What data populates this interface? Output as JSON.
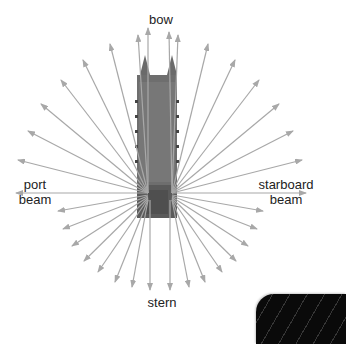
{
  "diagram": {
    "labels": {
      "bow": "bow",
      "port_line1": "port",
      "port_line2": "beam",
      "starboard_line1": "starboard",
      "starboard_line2": "beam",
      "stern": "stern"
    },
    "colors": {
      "arrow": "#a8a8a8",
      "hull": "#6e6e6e",
      "hull_dark": "#4f4f4f",
      "text": "#222222",
      "corner_shape": "#0a0a0a"
    },
    "icons": [
      "ship-hull-icon",
      "arrow-icon"
    ]
  }
}
